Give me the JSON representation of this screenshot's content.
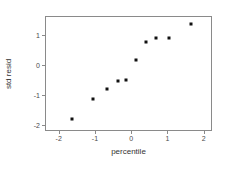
{
  "chart_data": {
    "type": "scatter",
    "title": "",
    "xlabel": "percentile",
    "ylabel": "std resid",
    "xlim": [
      -2.35,
      2.2
    ],
    "ylim": [
      -2.15,
      1.6
    ],
    "grid": false,
    "legend": null,
    "xticks": [
      -2,
      -1,
      0,
      1,
      2
    ],
    "xticklabels": [
      "-2",
      "-1",
      "0",
      "1",
      "2"
    ],
    "yticks": [
      1,
      0,
      -1,
      -2
    ],
    "yticklabels": [
      "1",
      "0",
      "-1",
      "-2"
    ],
    "marker": "square",
    "marker_color": "#111111",
    "frame_color": "#8a8a8a",
    "points": [
      {
        "x": -1.62,
        "y": -1.8
      },
      {
        "x": -1.06,
        "y": -1.12
      },
      {
        "x": -0.68,
        "y": -0.78
      },
      {
        "x": -0.37,
        "y": -0.52
      },
      {
        "x": -0.14,
        "y": -0.5
      },
      {
        "x": 0.12,
        "y": 0.17
      },
      {
        "x": 0.4,
        "y": 0.78
      },
      {
        "x": 0.68,
        "y": 0.89
      },
      {
        "x": 1.03,
        "y": 0.91
      },
      {
        "x": 1.66,
        "y": 1.37
      }
    ]
  }
}
